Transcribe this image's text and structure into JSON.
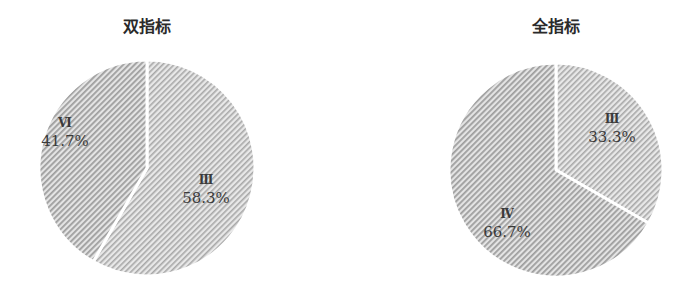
{
  "chart_data": [
    {
      "type": "pie",
      "title": "双指标",
      "categories": [
        "Ⅲ",
        "Ⅵ"
      ],
      "values": [
        58.3,
        41.7
      ],
      "labels": [
        "58.3%",
        "41.7%"
      ],
      "start_angle_deg": 0,
      "direction": "clockwise",
      "fill": "diagonal-hatch-gray",
      "legend": "none"
    },
    {
      "type": "pie",
      "title": "全指标",
      "categories": [
        "Ⅲ",
        "Ⅳ"
      ],
      "values": [
        33.3,
        66.7
      ],
      "labels": [
        "33.3%",
        "66.7%"
      ],
      "start_angle_deg": 0,
      "direction": "clockwise",
      "fill": "diagonal-hatch-gray",
      "legend": "none"
    }
  ],
  "charts": {
    "left": {
      "title": "双指标",
      "slices": [
        {
          "cat": "Ⅲ",
          "pct": "58.3%"
        },
        {
          "cat": "Ⅵ",
          "pct": "41.7%"
        }
      ]
    },
    "right": {
      "title": "全指标",
      "slices": [
        {
          "cat": "Ⅲ",
          "pct": "33.3%"
        },
        {
          "cat": "Ⅳ",
          "pct": "66.7%"
        }
      ]
    }
  },
  "colors": {
    "hatch_light": "#e6e6e6",
    "hatch_dark": "#9a9a9a",
    "separator": "#ffffff"
  }
}
